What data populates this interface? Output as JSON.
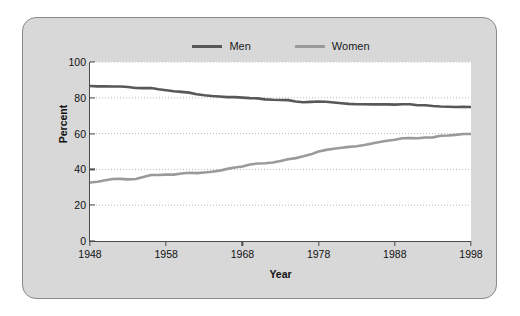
{
  "chart_data": {
    "type": "line",
    "title": "",
    "subtitle": "",
    "xlabel": "Year",
    "ylabel": "Percent",
    "xlim": [
      1948,
      1998
    ],
    "ylim": [
      0,
      100
    ],
    "xticks": [
      1948,
      1958,
      1968,
      1978,
      1988,
      1998
    ],
    "yticks": [
      0,
      20,
      40,
      60,
      80,
      100
    ],
    "grid": "horizontal-dotted",
    "legend_position": "top-center",
    "x": [
      1948,
      1949,
      1950,
      1951,
      1952,
      1953,
      1954,
      1955,
      1956,
      1957,
      1958,
      1959,
      1960,
      1961,
      1962,
      1963,
      1964,
      1965,
      1966,
      1967,
      1968,
      1969,
      1970,
      1971,
      1972,
      1973,
      1974,
      1975,
      1976,
      1977,
      1978,
      1979,
      1980,
      1981,
      1982,
      1983,
      1984,
      1985,
      1986,
      1987,
      1988,
      1989,
      1990,
      1991,
      1992,
      1993,
      1994,
      1995,
      1996,
      1997,
      1998
    ],
    "series": [
      {
        "name": "Men",
        "color": "#585858",
        "values": [
          86.6,
          86.4,
          86.4,
          86.3,
          86.3,
          86.0,
          85.5,
          85.4,
          85.5,
          84.8,
          84.2,
          83.7,
          83.3,
          82.9,
          82.0,
          81.4,
          81.0,
          80.7,
          80.4,
          80.4,
          80.1,
          79.8,
          79.7,
          79.1,
          78.9,
          78.8,
          78.7,
          77.9,
          77.5,
          77.7,
          77.9,
          77.8,
          77.4,
          77.0,
          76.6,
          76.4,
          76.4,
          76.3,
          76.3,
          76.3,
          76.2,
          76.4,
          76.4,
          75.8,
          75.8,
          75.4,
          75.1,
          75.0,
          74.9,
          75.0,
          74.9
        ]
      },
      {
        "name": "Women",
        "color": "#9a9a9a",
        "values": [
          32.7,
          33.1,
          33.9,
          34.6,
          34.7,
          34.4,
          34.6,
          35.7,
          36.9,
          36.9,
          37.1,
          37.1,
          37.7,
          38.1,
          37.9,
          38.3,
          38.7,
          39.3,
          40.3,
          41.1,
          41.6,
          42.7,
          43.3,
          43.4,
          43.9,
          44.7,
          45.7,
          46.3,
          47.3,
          48.4,
          50.0,
          50.9,
          51.5,
          52.1,
          52.6,
          52.9,
          53.6,
          54.5,
          55.3,
          56.0,
          56.6,
          57.4,
          57.5,
          57.4,
          57.8,
          57.9,
          58.8,
          58.9,
          59.3,
          59.8,
          59.8
        ]
      }
    ]
  },
  "legend": {
    "items": [
      {
        "label": "Men",
        "color": "#585858"
      },
      {
        "label": "Women",
        "color": "#9a9a9a"
      }
    ]
  },
  "axes": {
    "y_title": "Percent",
    "x_title": "Year",
    "y_ticks": [
      "0",
      "20",
      "40",
      "60",
      "80",
      "100"
    ],
    "x_ticks": [
      "1948",
      "1958",
      "1968",
      "1978",
      "1988",
      "1998"
    ]
  },
  "colors": {
    "panel_bg": "#d8d8d8",
    "plot_bg": "#ffffff",
    "axis": "#4a4a4a",
    "grid": "#b8b8b8",
    "men": "#585858",
    "women": "#9a9a9a"
  }
}
